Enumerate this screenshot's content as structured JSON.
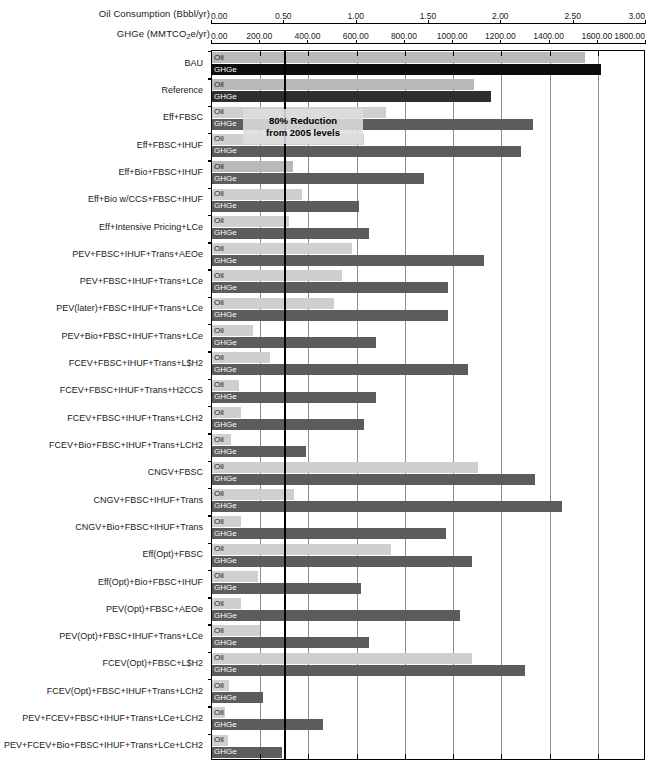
{
  "axes": {
    "oil": {
      "title": "Oil Consumption (Bbbl/yr)",
      "title_main": "Oil Consumption (Bbbl/yr)",
      "ticks": [
        "0.00",
        "0.50",
        "1.00",
        "1.50",
        "2.00",
        "2.50",
        "3.00"
      ],
      "min": 0.0,
      "max": 3.0
    },
    "ghge": {
      "title_pre": "GHGe (MMTCO",
      "title_sub": "2",
      "title_post": "e/yr)",
      "title_main": "GHGe (MMTCO2e/yr)",
      "ticks": [
        "0.00",
        "200.00",
        "400.00",
        "600.00",
        "800.00",
        "1000.00",
        "1200.00",
        "1400.00",
        "1600.00",
        "1800.00"
      ],
      "min": 0.0,
      "max": 1800.0
    }
  },
  "annotation": {
    "line1": "80% Reduction",
    "line2": "from 2005 levels",
    "target_value": 300.0
  },
  "series_labels": {
    "oil": "Oil",
    "ghge": "GHGe"
  },
  "colors": {
    "oil_light": "#cfcfcf",
    "oil_mid": "#b9b9b9",
    "ghge_dark": "#5c5c5c",
    "ghge_black": "#0d0d0d",
    "ghge_near_black": "#2e2e2e",
    "gridline": "#8c8c8c",
    "target_line": "#000000",
    "axis": "#000000"
  },
  "chart_data": {
    "type": "bar",
    "title": "",
    "subtitle": "",
    "orientation": "horizontal",
    "xlabel_top": "Oil Consumption (Bbbl/yr)",
    "xlabel_top2": "GHGe (MMTCO2e/yr)",
    "ylabel": "",
    "grid": true,
    "legend": "inline bar labels",
    "xlim_oil": [
      0.0,
      3.0
    ],
    "xlim_ghge": [
      0.0,
      1800.0
    ],
    "categories": [
      "BAU",
      "Reference",
      "Eff+FBSC",
      "Eff+FBSC+IHUF",
      "Eff+Bio+FBSC+IHUF",
      "Eff+Bio w/CCS+FBSC+IHUF",
      "Eff+Intensive Pricing+LCe",
      "PEV+FBSC+IHUF+Trans+AEOe",
      "PEV+FBSC+IHUF+Trans+LCe",
      "PEV(later)+FBSC+IHUF+Trans+LCe",
      "PEV+Bio+FBSC+IHUF+Trans+LCe",
      "FCEV+FBSC+IHUF+Trans+L$H2",
      "FCEV+FBSC+IHUF+Trans+H2CCS",
      "FCEV+FBSC+IHUF+Trans+LCH2",
      "FCEV+Bio+FBSC+IHUF+Trans+LCH2",
      "CNGV+FBSC",
      "CNGV+FBSC+IHUF+Trans",
      "CNGV+Bio+FBSC+IHUF+Trans",
      "Eff(Opt)+FBSC",
      "Eff(Opt)+Bio+FBSC+IHUF",
      "PEV(Opt)+FBSC+AEOe",
      "PEV(Opt)+FBSC+IHUF+Trans+LCe",
      "FCEV(Opt)+FBSC+L$H2",
      "FCEV(Opt)+FBSC+IHUF+Trans+LCH2",
      "PEV+FCEV+FBSC+IHUF+Trans+LCe+LCH2",
      "PEV+FCEV+Bio+FBSC+IHUF+Trans+LCe+LCH2"
    ],
    "series": [
      {
        "name": "Oil",
        "unit": "Bbbl/yr",
        "axis": "oil",
        "values": [
          2.58,
          1.81,
          1.2,
          1.05,
          0.56,
          0.62,
          0.53,
          0.97,
          0.9,
          0.84,
          0.28,
          0.4,
          0.19,
          0.2,
          0.13,
          1.84,
          0.57,
          0.2,
          1.24,
          0.32,
          0.2,
          0.33,
          1.8,
          0.12,
          0.09,
          0.11
        ]
      },
      {
        "name": "GHGe",
        "unit": "MMTCO2e/yr",
        "axis": "ghge",
        "values": [
          1613,
          1157,
          1330,
          1280,
          880,
          610,
          650,
          1130,
          980,
          980,
          680,
          1060,
          680,
          630,
          390,
          1340,
          1450,
          970,
          1080,
          620,
          1030,
          650,
          1300,
          210,
          460,
          290
        ]
      }
    ],
    "target_reference_line": {
      "label": "80% Reduction from 2005 levels",
      "value_ghge": 300.0
    }
  },
  "bars": [
    {
      "label": "BAU",
      "oil": 2.58,
      "ghge": 1613,
      "oil_tone": "mid",
      "ghge_tone": "black"
    },
    {
      "label": "Reference",
      "oil": 1.81,
      "ghge": 1157,
      "oil_tone": "mid",
      "ghge_tone": "near_black"
    },
    {
      "label": "Eff+FBSC",
      "oil": 1.2,
      "ghge": 1330,
      "oil_tone": "light",
      "ghge_tone": "dark"
    },
    {
      "label": "Eff+FBSC+IHUF",
      "oil": 1.05,
      "ghge": 1280,
      "oil_tone": "light",
      "ghge_tone": "dark"
    },
    {
      "label": "Eff+Bio+FBSC+IHUF",
      "oil": 0.56,
      "ghge": 880,
      "oil_tone": "mid",
      "ghge_tone": "dark"
    },
    {
      "label": "Eff+Bio w/CCS+FBSC+IHUF",
      "oil": 0.62,
      "ghge": 610,
      "oil_tone": "light",
      "ghge_tone": "dark"
    },
    {
      "label": "Eff+Intensive Pricing+LCe",
      "oil": 0.53,
      "ghge": 650,
      "oil_tone": "light",
      "ghge_tone": "dark"
    },
    {
      "label": "PEV+FBSC+IHUF+Trans+AEOe",
      "oil": 0.97,
      "ghge": 1130,
      "oil_tone": "light",
      "ghge_tone": "dark"
    },
    {
      "label": "PEV+FBSC+IHUF+Trans+LCe",
      "oil": 0.9,
      "ghge": 980,
      "oil_tone": "light",
      "ghge_tone": "dark"
    },
    {
      "label": "PEV(later)+FBSC+IHUF+Trans+LCe",
      "oil": 0.84,
      "ghge": 980,
      "oil_tone": "light",
      "ghge_tone": "dark"
    },
    {
      "label": "PEV+Bio+FBSC+IHUF+Trans+LCe",
      "oil": 0.28,
      "ghge": 680,
      "oil_tone": "light",
      "ghge_tone": "dark"
    },
    {
      "label": "FCEV+FBSC+IHUF+Trans+L$H2",
      "oil": 0.4,
      "ghge": 1060,
      "oil_tone": "light",
      "ghge_tone": "dark"
    },
    {
      "label": "FCEV+FBSC+IHUF+Trans+H2CCS",
      "oil": 0.19,
      "ghge": 680,
      "oil_tone": "light",
      "ghge_tone": "dark"
    },
    {
      "label": "FCEV+FBSC+IHUF+Trans+LCH2",
      "oil": 0.2,
      "ghge": 630,
      "oil_tone": "light",
      "ghge_tone": "dark"
    },
    {
      "label": "FCEV+Bio+FBSC+IHUF+Trans+LCH2",
      "oil": 0.13,
      "ghge": 390,
      "oil_tone": "light",
      "ghge_tone": "dark"
    },
    {
      "label": "CNGV+FBSC",
      "oil": 1.84,
      "ghge": 1340,
      "oil_tone": "light",
      "ghge_tone": "dark"
    },
    {
      "label": "CNGV+FBSC+IHUF+Trans",
      "oil": 0.57,
      "ghge": 1450,
      "oil_tone": "light",
      "ghge_tone": "dark"
    },
    {
      "label": "CNGV+Bio+FBSC+IHUF+Trans",
      "oil": 0.2,
      "ghge": 970,
      "oil_tone": "light",
      "ghge_tone": "dark"
    },
    {
      "label": "Eff(Opt)+FBSC",
      "oil": 1.24,
      "ghge": 1080,
      "oil_tone": "light",
      "ghge_tone": "dark"
    },
    {
      "label": "Eff(Opt)+Bio+FBSC+IHUF",
      "oil": 0.32,
      "ghge": 620,
      "oil_tone": "light",
      "ghge_tone": "dark"
    },
    {
      "label": "PEV(Opt)+FBSC+AEOe",
      "oil": 0.2,
      "ghge": 1030,
      "oil_tone": "light",
      "ghge_tone": "dark"
    },
    {
      "label": "PEV(Opt)+FBSC+IHUF+Trans+LCe",
      "oil": 0.33,
      "ghge": 650,
      "oil_tone": "light",
      "ghge_tone": "dark"
    },
    {
      "label": "FCEV(Opt)+FBSC+L$H2",
      "oil": 1.8,
      "ghge": 1300,
      "oil_tone": "light",
      "ghge_tone": "dark"
    },
    {
      "label": "FCEV(Opt)+FBSC+IHUF+Trans+LCH2",
      "oil": 0.12,
      "ghge": 210,
      "oil_tone": "light",
      "ghge_tone": "dark"
    },
    {
      "label": "PEV+FCEV+FBSC+IHUF+Trans+LCe+LCH2",
      "oil": 0.09,
      "ghge": 460,
      "oil_tone": "light",
      "ghge_tone": "dark"
    },
    {
      "label": "PEV+FCEV+Bio+FBSC+IHUF+Trans+LCe+LCH2",
      "oil": 0.11,
      "ghge": 290,
      "oil_tone": "light",
      "ghge_tone": "dark"
    }
  ],
  "caption": {
    "text": ""
  }
}
